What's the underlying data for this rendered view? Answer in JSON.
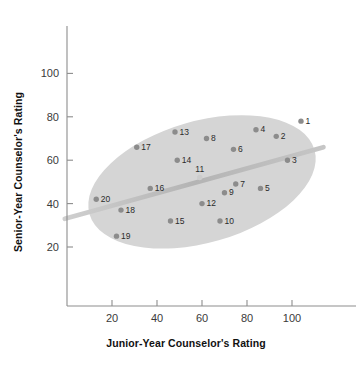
{
  "chart_data": {
    "type": "scatter",
    "title": "",
    "xlabel": "Junior-Year Counselor's Rating",
    "ylabel": "Senior-Year Counselor's Rating",
    "xlim": [
      0,
      124
    ],
    "ylim": [
      10,
      116
    ],
    "xticks": [
      20,
      40,
      60,
      80,
      100
    ],
    "yticks": [
      20,
      40,
      60,
      80,
      100
    ],
    "grid": false,
    "legend": null,
    "point_color": "#8c8c8c",
    "ellipse_color": "#d5d5d5",
    "trendline_color": "#b9b9b9",
    "points": [
      {
        "label": "1",
        "x": 104,
        "y": 78
      },
      {
        "label": "2",
        "x": 93,
        "y": 71
      },
      {
        "label": "3",
        "x": 98,
        "y": 60
      },
      {
        "label": "4",
        "x": 84,
        "y": 74
      },
      {
        "label": "5",
        "x": 86,
        "y": 47
      },
      {
        "label": "6",
        "x": 74,
        "y": 65
      },
      {
        "label": "7",
        "x": 75,
        "y": 49
      },
      {
        "label": "8",
        "x": 62,
        "y": 70
      },
      {
        "label": "9",
        "x": 70,
        "y": 45
      },
      {
        "label": "10",
        "x": 68,
        "y": 32
      },
      {
        "label": "11",
        "x": 59,
        "y": 52
      },
      {
        "label": "12",
        "x": 60,
        "y": 40
      },
      {
        "label": "13",
        "x": 48,
        "y": 73
      },
      {
        "label": "14",
        "x": 49,
        "y": 60
      },
      {
        "label": "15",
        "x": 46,
        "y": 32
      },
      {
        "label": "16",
        "x": 37,
        "y": 47
      },
      {
        "label": "17",
        "x": 31,
        "y": 66
      },
      {
        "label": "18",
        "x": 24,
        "y": 37
      },
      {
        "label": "19",
        "x": 22,
        "y": 25
      },
      {
        "label": "20",
        "x": 13,
        "y": 42
      }
    ],
    "trendline": {
      "x0": -1,
      "y0": 33,
      "x1": 114,
      "y1": 66
    },
    "ellipse": {
      "center_x": 60,
      "center_y": 50,
      "radius_x": 52,
      "radius_y": 28,
      "rotation_deg": -16
    }
  }
}
